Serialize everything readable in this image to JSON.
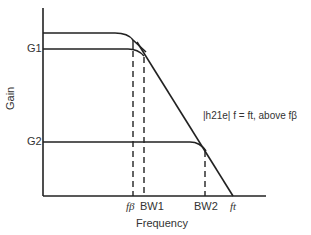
{
  "diagram": {
    "type": "gain-frequency plot",
    "ylabel": "Gain",
    "xlabel": "Frequency",
    "y_ticks": [
      "G1",
      "G2"
    ],
    "x_ticks": [
      "fβ",
      "BW1",
      "BW2",
      "ft"
    ],
    "annotation": "|h21e| f = ft, above fβ",
    "colors": {
      "line": "#222222",
      "background": "#ffffff"
    }
  }
}
